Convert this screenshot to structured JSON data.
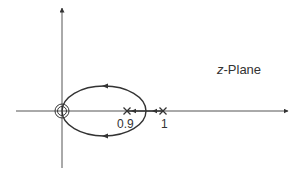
{
  "diagram": {
    "type": "root-locus",
    "plane_label_italic": "z",
    "plane_label_rest": "-Plane",
    "poles": [
      {
        "value": 0.9,
        "label": "0.9"
      },
      {
        "value": 1,
        "label": "1"
      }
    ],
    "zeros": [
      {
        "value": 0,
        "multiplicity": 2
      }
    ],
    "colors": {
      "line": "#333333",
      "axis": "#555555",
      "background": "#ffffff"
    }
  }
}
